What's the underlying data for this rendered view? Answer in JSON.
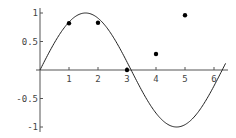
{
  "chart_data": {
    "type": "scatter",
    "title": "",
    "xlabel": "",
    "ylabel": "",
    "xlim": [
      0,
      6.6
    ],
    "ylim": [
      -1,
      1
    ],
    "grid": false,
    "legend": null,
    "x_ticks": [
      "1",
      "2",
      "3",
      "4",
      "5",
      "6"
    ],
    "y_ticks": [
      "1",
      "0.5",
      "-0.5",
      "-1"
    ],
    "series": [
      {
        "name": "points",
        "kind": "scatter",
        "x": [
          1,
          2,
          3,
          4,
          5
        ],
        "y": [
          0.82,
          0.83,
          0.0,
          0.28,
          0.96
        ]
      },
      {
        "name": "sin(x)",
        "kind": "line",
        "function": "sin(x)",
        "x_range": [
          0,
          6.4
        ]
      }
    ]
  },
  "colors": {
    "axis": "#555555",
    "curve": "#222222",
    "points": "#000000",
    "labels": "#444444"
  }
}
